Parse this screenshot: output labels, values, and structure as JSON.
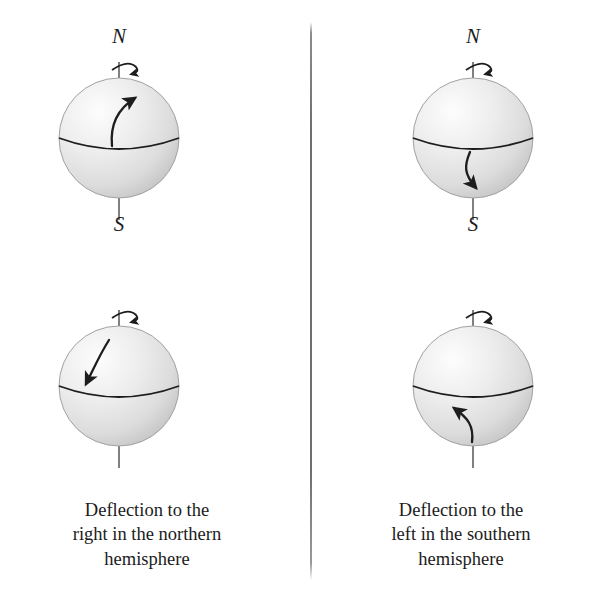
{
  "figure": {
    "divider": {
      "name": "vertical-divider",
      "color": "#6e6e6e"
    }
  },
  "style": {
    "sphere_highlight": "#fdfdfd",
    "sphere_midtone": "#e4e4e4",
    "sphere_shadow": "#c4c4c4",
    "sphere_edge": "#9d9d9d",
    "line_color": "#1d1d1d",
    "axis_color": "#6a6a6a"
  },
  "columns": [
    {
      "id": "northern-hemisphere",
      "caption_lines": [
        "Deflection to the",
        "right in the northern",
        "hemisphere"
      ],
      "globes": [
        {
          "id": "northern-poleward-flow",
          "pole_north_label": "N",
          "pole_south_label": "S",
          "rotation_sense": "counterclockwise-viewed-from-north",
          "flow_description": "northward flow deflected to the right (east)",
          "flow_start": "equator, center",
          "flow_end": "mid-northern latitude, east of start"
        },
        {
          "id": "northern-equatorward-flow",
          "pole_north_label": "",
          "pole_south_label": "",
          "rotation_sense": "counterclockwise-viewed-from-north",
          "flow_description": "southward flow deflected to the right (west)",
          "flow_start": "high northern latitude, center",
          "flow_end": "near equator, west of start"
        }
      ]
    },
    {
      "id": "southern-hemisphere",
      "caption_lines": [
        "Deflection to the",
        "left in the southern",
        "hemisphere"
      ],
      "globes": [
        {
          "id": "southern-poleward-flow",
          "pole_north_label": "N",
          "pole_south_label": "S",
          "rotation_sense": "counterclockwise-viewed-from-north",
          "flow_description": "southward flow deflected to the left (east)",
          "flow_start": "equator, center",
          "flow_end": "mid-southern latitude, east of start"
        },
        {
          "id": "southern-equatorward-flow",
          "pole_north_label": "",
          "pole_south_label": "",
          "rotation_sense": "counterclockwise-viewed-from-north",
          "flow_description": "northward flow deflected to the left (west)",
          "flow_start": "high southern latitude, center",
          "flow_end": "near equator, west of start"
        }
      ]
    }
  ]
}
